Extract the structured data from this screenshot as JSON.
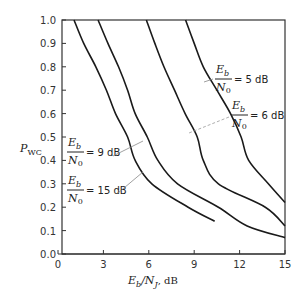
{
  "chart_data": {
    "type": "line",
    "title": "",
    "xlabel": "E_b/N_J, dB",
    "ylabel": "P_WC",
    "xlim": [
      0,
      15
    ],
    "ylim": [
      0.0,
      1.0
    ],
    "x_ticks": [
      "0",
      "3",
      "6",
      "9",
      "12",
      "15"
    ],
    "y_ticks": [
      "0.0",
      "0.1",
      "0.2",
      "0.3",
      "0.4",
      "0.5",
      "0.6",
      "0.7",
      "0.8",
      "0.9",
      "1.0"
    ],
    "grid": false,
    "legend": "inline annotations",
    "series": [
      {
        "name": "Eb/N0 = 15 dB",
        "points": [
          [
            1.06,
            1.0
          ],
          [
            1.7,
            0.9
          ],
          [
            2.5,
            0.8
          ],
          [
            3.2,
            0.7
          ],
          [
            3.8,
            0.6
          ],
          [
            4.6,
            0.5
          ],
          [
            5.1,
            0.4
          ],
          [
            6.2,
            0.3
          ],
          [
            8.6,
            0.2
          ],
          [
            10.35,
            0.14
          ]
        ]
      },
      {
        "name": "Eb/N0 = 9 dB",
        "points": [
          [
            2.65,
            1.0
          ],
          [
            3.3,
            0.9
          ],
          [
            4.0,
            0.8
          ],
          [
            4.6,
            0.7
          ],
          [
            5.1,
            0.6
          ],
          [
            5.9,
            0.5
          ],
          [
            6.6,
            0.4
          ],
          [
            7.9,
            0.3
          ],
          [
            10.6,
            0.2
          ],
          [
            12.5,
            0.12
          ],
          [
            15.0,
            0.07
          ]
        ]
      },
      {
        "name": "Eb/N0 = 6 dB",
        "points": [
          [
            5.84,
            1.0
          ],
          [
            6.4,
            0.9
          ],
          [
            7.0,
            0.8
          ],
          [
            7.7,
            0.7
          ],
          [
            8.4,
            0.6
          ],
          [
            9.2,
            0.5
          ],
          [
            9.6,
            0.4
          ],
          [
            10.6,
            0.3
          ],
          [
            13.7,
            0.2
          ],
          [
            15.0,
            0.12
          ]
        ]
      },
      {
        "name": "Eb/N0 = 5 dB",
        "points": [
          [
            8.43,
            1.0
          ],
          [
            9.0,
            0.9
          ],
          [
            9.6,
            0.8
          ],
          [
            10.5,
            0.7
          ],
          [
            11.4,
            0.6
          ],
          [
            12.1,
            0.5
          ],
          [
            12.6,
            0.4
          ],
          [
            13.9,
            0.3
          ],
          [
            15.0,
            0.22
          ]
        ]
      }
    ],
    "annotations": [
      {
        "text_num": "E_b",
        "text_den": "N_0",
        "value": "= 5 dB"
      },
      {
        "text_num": "E_b",
        "text_den": "N_0",
        "value": "= 6 dB"
      },
      {
        "text_num": "E_b",
        "text_den": "N_0",
        "value": "= 9 dB"
      },
      {
        "text_num": "E_b",
        "text_den": "N_0",
        "value": "= 15 dB"
      }
    ]
  },
  "labels": {
    "ylabel_main": "P",
    "ylabel_sub": "WC",
    "xlabel_num_main": "E",
    "xlabel_num_sub": "b",
    "xlabel_den_main": "N",
    "xlabel_den_sub": "J",
    "xlabel_unit": ", dB",
    "ann_num": "E",
    "ann_num_sub": "b",
    "ann_den": "N",
    "ann_den_sub": "0",
    "ann5": "= 5 dB",
    "ann6": "= 6 dB",
    "ann9": "= 9 dB",
    "ann15": "= 15 dB"
  }
}
